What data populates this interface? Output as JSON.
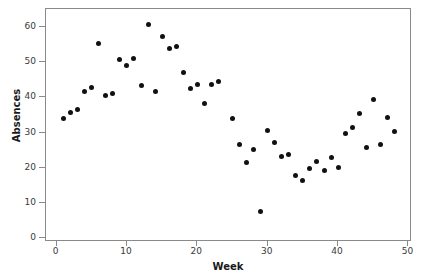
{
  "chart_data": {
    "type": "scatter",
    "title": "",
    "xlabel": "Week",
    "ylabel": "Absences",
    "xlim": [
      -1.5,
      50.5
    ],
    "ylim": [
      -1.0,
      65.0
    ],
    "xticks": [
      0,
      10,
      20,
      30,
      40,
      50
    ],
    "yticks": [
      0,
      10,
      20,
      30,
      40,
      50,
      60
    ],
    "grid": false,
    "legend": null,
    "marker": "filled-circle",
    "marker_color": "#111111",
    "frame_color": "#8a8a8a",
    "background": "#ffffff",
    "x": [
      1,
      2,
      3,
      4,
      5,
      6,
      7,
      8,
      9,
      10,
      11,
      12,
      13,
      14,
      15,
      16,
      17,
      18,
      19,
      20,
      21,
      22,
      23,
      25,
      26,
      27,
      28,
      29,
      30,
      31,
      32,
      33,
      34,
      35,
      36,
      37,
      38,
      39,
      40,
      41,
      42,
      43,
      44,
      45,
      46,
      47,
      48
    ],
    "y": [
      33.9,
      35.8,
      36.5,
      41.5,
      42.9,
      55.2,
      40.5,
      41.2,
      50.8,
      49.0,
      51.0,
      43.4,
      60.5,
      41.6,
      57.3,
      53.8,
      54.3,
      46.9,
      42.4,
      43.7,
      38.3,
      43.6,
      44.5,
      34.1,
      26.6,
      21.6,
      25.2,
      7.6,
      30.5,
      27.3,
      23.1,
      23.9,
      17.8,
      16.5,
      19.7,
      21.8,
      19.2,
      22.9,
      20.2,
      29.7,
      31.5,
      35.3,
      25.7,
      39.5,
      26.5,
      34.4,
      30.2
    ],
    "points": [
      {
        "week": 1,
        "absences": 33.9
      },
      {
        "week": 2,
        "absences": 35.8
      },
      {
        "week": 3,
        "absences": 36.5
      },
      {
        "week": 4,
        "absences": 41.5
      },
      {
        "week": 5,
        "absences": 42.9
      },
      {
        "week": 6,
        "absences": 55.2
      },
      {
        "week": 7,
        "absences": 40.5
      },
      {
        "week": 8,
        "absences": 41.2
      },
      {
        "week": 9,
        "absences": 50.8
      },
      {
        "week": 10,
        "absences": 49.0
      },
      {
        "week": 11,
        "absences": 51.0
      },
      {
        "week": 12,
        "absences": 43.4
      },
      {
        "week": 13,
        "absences": 60.5
      },
      {
        "week": 14,
        "absences": 41.6
      },
      {
        "week": 15,
        "absences": 57.3
      },
      {
        "week": 16,
        "absences": 53.8
      },
      {
        "week": 17,
        "absences": 54.3
      },
      {
        "week": 18,
        "absences": 46.9
      },
      {
        "week": 19,
        "absences": 42.4
      },
      {
        "week": 20,
        "absences": 43.7
      },
      {
        "week": 21,
        "absences": 38.3
      },
      {
        "week": 22,
        "absences": 43.6
      },
      {
        "week": 23,
        "absences": 44.5
      },
      {
        "week": 25,
        "absences": 34.1
      },
      {
        "week": 26,
        "absences": 26.6
      },
      {
        "week": 27,
        "absences": 21.6
      },
      {
        "week": 28,
        "absences": 25.2
      },
      {
        "week": 29,
        "absences": 7.6
      },
      {
        "week": 30,
        "absences": 30.5
      },
      {
        "week": 31,
        "absences": 27.3
      },
      {
        "week": 32,
        "absences": 23.1
      },
      {
        "week": 33,
        "absences": 23.9
      },
      {
        "week": 34,
        "absences": 17.8
      },
      {
        "week": 35,
        "absences": 16.5
      },
      {
        "week": 36,
        "absences": 19.7
      },
      {
        "week": 37,
        "absences": 21.8
      },
      {
        "week": 38,
        "absences": 19.2
      },
      {
        "week": 39,
        "absences": 22.9
      },
      {
        "week": 40,
        "absences": 20.2
      },
      {
        "week": 41,
        "absences": 29.7
      },
      {
        "week": 42,
        "absences": 31.5
      },
      {
        "week": 43,
        "absences": 35.3
      },
      {
        "week": 44,
        "absences": 25.7
      },
      {
        "week": 45,
        "absences": 39.5
      },
      {
        "week": 46,
        "absences": 26.5
      },
      {
        "week": 47,
        "absences": 34.4
      },
      {
        "week": 48,
        "absences": 30.2
      }
    ]
  }
}
